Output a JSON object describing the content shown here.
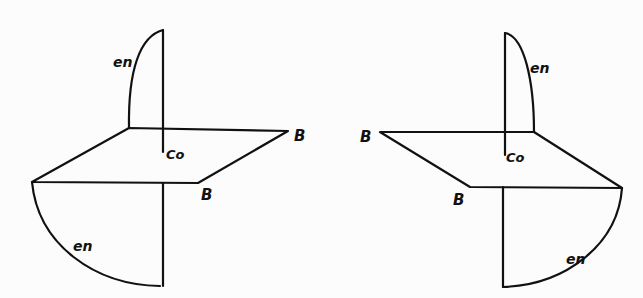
{
  "figures": [
    {
      "id": "left",
      "labels": {
        "upper_lobe": "en",
        "center": "Co",
        "back_corner": "B",
        "front_corner": "B",
        "lower_lobe": "en"
      }
    },
    {
      "id": "right",
      "labels": {
        "upper_lobe": "en",
        "center": "Co",
        "back_corner": "B",
        "front_corner": "B",
        "lower_lobe": "en"
      }
    }
  ],
  "colors": {
    "line": "#111111",
    "background": "#fcfcfc"
  }
}
